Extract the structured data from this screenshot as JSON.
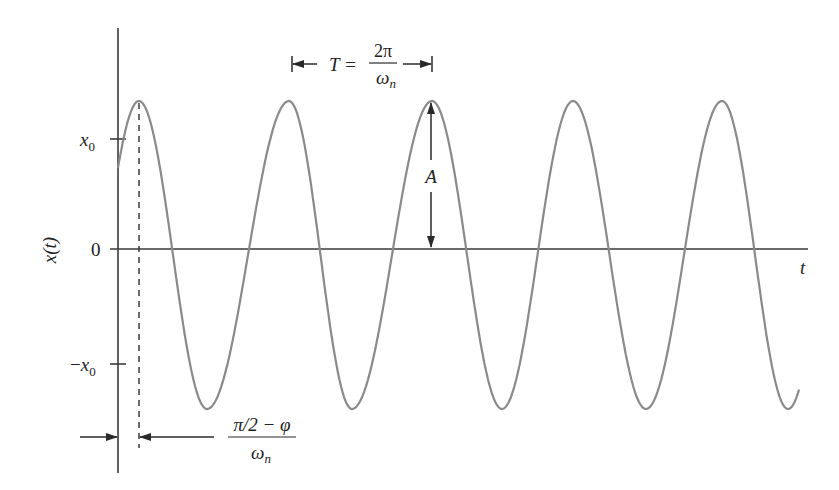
{
  "figure": {
    "colors": {
      "axis": "#3a3a3a",
      "curve": "#8a8a8a",
      "annotation": "#2a2a2a",
      "background": "#ffffff"
    },
    "axes": {
      "y_label": "x(t)",
      "x_label": "t",
      "y_ticks": [
        {
          "label_main": "x",
          "label_sub": "0",
          "prefix": "",
          "y": 139
        },
        {
          "label_main": "0",
          "label_sub": "",
          "prefix": "",
          "y": 249
        },
        {
          "label_main": "x",
          "label_sub": "0",
          "prefix": "−",
          "y": 364
        }
      ]
    },
    "annotations": {
      "period": {
        "lhs": "T =",
        "numerator": "2π",
        "denominator_main": "ω",
        "denominator_sub": "n"
      },
      "amplitude": {
        "label": "A"
      },
      "phase_offset": {
        "numerator": "π/2 − φ",
        "denominator_main": "ω",
        "denominator_sub": "n"
      }
    }
  },
  "chart_data": {
    "type": "line",
    "title": "",
    "xlabel": "t",
    "ylabel": "x(t)",
    "y_tick_labels": [
      "x0",
      "0",
      "−x0"
    ],
    "x_tick_labels": [],
    "grid": false,
    "legend": null,
    "cycles_shown": 5,
    "extrema_px": [
      {
        "x": 118,
        "y": 128,
        "kind": "start"
      },
      {
        "x": 139,
        "y": 101,
        "kind": "peak"
      },
      {
        "x": 207,
        "y": 409,
        "kind": "trough"
      },
      {
        "x": 289,
        "y": 101,
        "kind": "peak"
      },
      {
        "x": 352,
        "y": 409,
        "kind": "trough"
      },
      {
        "x": 432,
        "y": 101,
        "kind": "peak"
      },
      {
        "x": 502,
        "y": 409,
        "kind": "trough"
      },
      {
        "x": 573,
        "y": 101,
        "kind": "peak"
      },
      {
        "x": 646,
        "y": 409,
        "kind": "trough"
      },
      {
        "x": 722,
        "y": 101,
        "kind": "peak"
      },
      {
        "x": 788,
        "y": 409,
        "kind": "trough"
      },
      {
        "x": 799,
        "y": 396,
        "kind": "end"
      }
    ]
  }
}
